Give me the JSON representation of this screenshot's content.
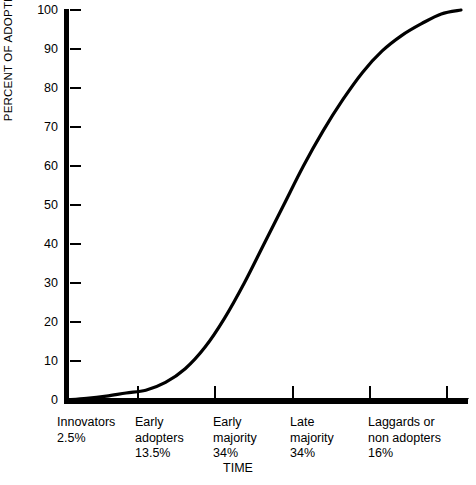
{
  "chart_data": {
    "type": "line",
    "title": "",
    "xlabel": "TIME",
    "ylabel": "PERCENT OF ADOPTION",
    "ylim": [
      0,
      100
    ],
    "grid": false,
    "legend": "none",
    "y_ticks": [
      100,
      90,
      80,
      70,
      60,
      50,
      40,
      30,
      20,
      10,
      0
    ],
    "y_tick_labels": [
      "100",
      "90",
      "80",
      "70",
      "60",
      "50",
      "40",
      "30",
      "20",
      "10",
      "0"
    ],
    "x_axis_kind": "categorical-segments",
    "series": [
      {
        "name": "Cumulative percent of adoption",
        "x": [
          0,
          5,
          10,
          15,
          20,
          25,
          30,
          35,
          40,
          45,
          50,
          55,
          60,
          65,
          70,
          75,
          80,
          85,
          90,
          95,
          100
        ],
        "values": [
          0,
          0.4,
          1.0,
          1.8,
          2.5,
          4.5,
          8.0,
          13.5,
          21,
          30,
          40,
          50,
          60,
          69,
          77,
          84,
          89.5,
          93.5,
          96.5,
          99,
          100
        ]
      }
    ],
    "segments": [
      {
        "name": "Innovators",
        "label": "Innovators\n2.5%",
        "percent": 2.5,
        "percent_label": "2.5%"
      },
      {
        "name": "Early adopters",
        "label": "Early\nadopters\n13.5%",
        "percent": 13.5,
        "percent_label": "13.5%"
      },
      {
        "name": "Early majority",
        "label": "Early\nmajority\n34%",
        "percent": 34,
        "percent_label": "34%"
      },
      {
        "name": "Late majority",
        "label": "Late\nmajority\n34%",
        "percent": 34,
        "percent_label": "34%"
      },
      {
        "name": "Laggards or non adopters",
        "label": "Laggards or\nnon adopters\n16%",
        "percent": 16,
        "percent_label": "16%"
      }
    ],
    "colors": {
      "curve": "#000000",
      "axis": "#000000",
      "background": "#ffffff"
    }
  }
}
